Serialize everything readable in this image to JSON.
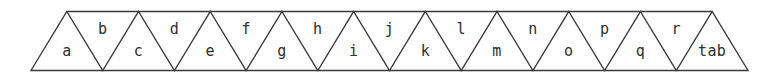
{
  "figure": {
    "kind": "triangle-strip",
    "geometry": {
      "left_x": 31,
      "right_x": 748,
      "top_y": 11.5,
      "bottom_y": 70.5,
      "half_pitch": 35.85,
      "triangle_count": 19
    },
    "colors": {
      "background": "#ffffff",
      "face_fill": "#fefefe",
      "line": "#3a3a3a",
      "text": "#2f2f2f"
    },
    "triangles": [
      {
        "label": "a",
        "orientation": "up",
        "index": 0
      },
      {
        "label": "b",
        "orientation": "down",
        "index": 1
      },
      {
        "label": "c",
        "orientation": "up",
        "index": 2
      },
      {
        "label": "d",
        "orientation": "down",
        "index": 3
      },
      {
        "label": "e",
        "orientation": "up",
        "index": 4
      },
      {
        "label": "f",
        "orientation": "down",
        "index": 5
      },
      {
        "label": "g",
        "orientation": "up",
        "index": 6
      },
      {
        "label": "h",
        "orientation": "down",
        "index": 7
      },
      {
        "label": "i",
        "orientation": "up",
        "index": 8
      },
      {
        "label": "j",
        "orientation": "down",
        "index": 9
      },
      {
        "label": "k",
        "orientation": "up",
        "index": 10
      },
      {
        "label": "l",
        "orientation": "down",
        "index": 11
      },
      {
        "label": "m",
        "orientation": "up",
        "index": 12
      },
      {
        "label": "n",
        "orientation": "down",
        "index": 13
      },
      {
        "label": "o",
        "orientation": "up",
        "index": 14
      },
      {
        "label": "p",
        "orientation": "down",
        "index": 15
      },
      {
        "label": "q",
        "orientation": "up",
        "index": 16
      },
      {
        "label": "r",
        "orientation": "down",
        "index": 17
      },
      {
        "label": "tab",
        "orientation": "up",
        "index": 18
      }
    ]
  }
}
